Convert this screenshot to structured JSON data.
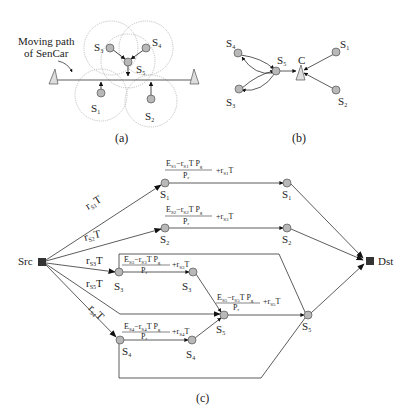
{
  "figure": {
    "panels": [
      {
        "id": "a",
        "caption": "(a)",
        "annotation_line1": "Moving path",
        "annotation_line2": "of SenCar",
        "nodes": [
          {
            "name": "S",
            "sub": "1"
          },
          {
            "name": "S",
            "sub": "2"
          },
          {
            "name": "S",
            "sub": "3"
          },
          {
            "name": "S",
            "sub": "4"
          },
          {
            "name": "S",
            "sub": "5"
          }
        ]
      },
      {
        "id": "b",
        "caption": "(b)",
        "collector_label": "C",
        "nodes": [
          {
            "name": "S",
            "sub": "1"
          },
          {
            "name": "S",
            "sub": "2"
          },
          {
            "name": "S",
            "sub": "3"
          },
          {
            "name": "S",
            "sub": "4"
          },
          {
            "name": "S",
            "sub": "5"
          }
        ]
      },
      {
        "id": "c",
        "caption": "(c)",
        "source_label": "Src",
        "dest_label": "Dst",
        "src_edges": [
          {
            "r": "r",
            "sub": "S1",
            "t": "T"
          },
          {
            "r": "r",
            "sub": "S2",
            "t": "T"
          },
          {
            "r": "r",
            "sub": "S3",
            "t": "T"
          },
          {
            "r": "r",
            "sub": "S5",
            "t": "T"
          },
          {
            "r": "r",
            "sub": "S4",
            "t": "T"
          }
        ],
        "flow_nodes": [
          {
            "name": "S",
            "sub": "1",
            "mark": "'"
          },
          {
            "name": "S",
            "sub": "1",
            "mark": "\""
          },
          {
            "name": "S",
            "sub": "2",
            "mark": "'"
          },
          {
            "name": "S",
            "sub": "2",
            "mark": "\""
          },
          {
            "name": "S",
            "sub": "3",
            "mark": "'"
          },
          {
            "name": "S",
            "sub": "3",
            "mark": "\""
          },
          {
            "name": "S",
            "sub": "4",
            "mark": "'"
          },
          {
            "name": "S",
            "sub": "4",
            "mark": "\""
          },
          {
            "name": "S",
            "sub": "5",
            "mark": "'"
          },
          {
            "name": "S",
            "sub": "5",
            "mark": "\""
          }
        ],
        "capacities": [
          {
            "numerator_E": "E",
            "E_sub": "S1",
            "minus": "−",
            "r": "r",
            "r_sub": "S1",
            "tail": "T P",
            "pg_sub": "g",
            "denominator": "P",
            "den_sub": "r",
            "plus": "+",
            "plus_r": "r",
            "plus_sub": "S1",
            "plus_t": "T"
          },
          {
            "numerator_E": "E",
            "E_sub": "S2",
            "minus": "−",
            "r": "r",
            "r_sub": "S2",
            "tail": "T P",
            "pg_sub": "g",
            "denominator": "P",
            "den_sub": "r",
            "plus": "+",
            "plus_r": "r",
            "plus_sub": "S3",
            "plus_t": "T"
          },
          {
            "numerator_E": "E",
            "E_sub": "S3",
            "minus": "−",
            "r": "r",
            "r_sub": "S3",
            "tail": "T P",
            "pg_sub": "g",
            "denominator": "P",
            "den_sub": "r",
            "plus": "+",
            "plus_r": "r",
            "plus_sub": "S3",
            "plus_t": "T"
          },
          {
            "numerator_E": "E",
            "E_sub": "S4",
            "minus": "−",
            "r": "r",
            "r_sub": "S4",
            "tail": "T P",
            "pg_sub": "g",
            "denominator": "P",
            "den_sub": "r",
            "plus": "+",
            "plus_r": "r",
            "plus_sub": "S4",
            "plus_t": "T"
          },
          {
            "numerator_E": "E",
            "E_sub": "S5",
            "minus": "−",
            "r": "r",
            "r_sub": "S5",
            "tail": "T P",
            "pg_sub": "g",
            "denominator": "P",
            "den_sub": "r",
            "plus": "+",
            "plus_r": "r",
            "plus_sub": "S5",
            "plus_t": "T"
          }
        ]
      }
    ],
    "colors": {
      "node_fill": "#b8b8b8",
      "node_stroke": "#555555",
      "line": "#333333",
      "range_circle": "#aaaaaa",
      "terminal_fill": "#333333"
    }
  }
}
